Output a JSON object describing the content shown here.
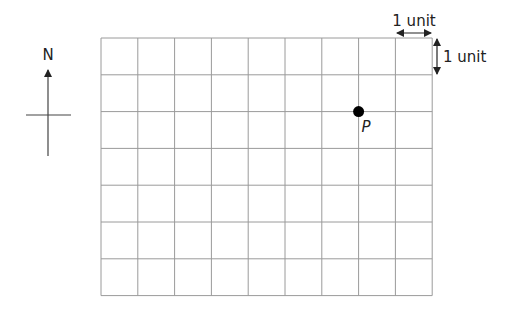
{
  "diagram": {
    "grid": {
      "columns": 9,
      "rows": 7
    },
    "compass": {
      "label": "N"
    },
    "scale": {
      "horizontal_label": "1 unit",
      "vertical_label": "1 unit"
    },
    "points": [
      {
        "label": "P",
        "grid_col": 7,
        "grid_row": 2
      }
    ],
    "colors": {
      "grid": "#9a9a9a",
      "ink": "#222222",
      "point": "#000000"
    }
  }
}
